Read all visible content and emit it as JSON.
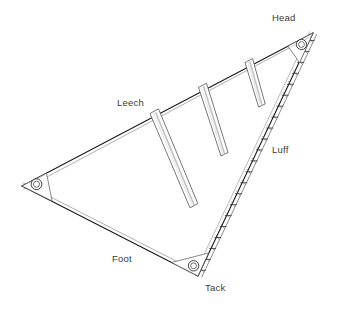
{
  "diagram": {
    "type": "line-drawing",
    "background_color": "#ffffff",
    "line_color": "#1a1a1a",
    "shade_color": "#b8b8b8",
    "label_color": "#3a3a3a",
    "labels": {
      "head": "Head",
      "leech": "Leech",
      "luff": "Luff",
      "foot": "Foot",
      "tack": "Tack"
    },
    "geometry": {
      "head_point": [
        313,
        33
      ],
      "clew_point": [
        22,
        186
      ],
      "tack_point": [
        198,
        276
      ],
      "edges": [
        {
          "name": "leech",
          "from": "head",
          "to": "clew"
        },
        {
          "name": "luff",
          "from": "head",
          "to": "tack"
        },
        {
          "name": "foot",
          "from": "clew",
          "to": "tack"
        }
      ]
    },
    "features": {
      "grommet_count": 3,
      "grommet_names": [
        "head-grommet",
        "clew-grommet",
        "tack-grommet"
      ],
      "batten_count": 3,
      "luff_slide_count": 22,
      "reinforcement_patches": 3
    }
  }
}
